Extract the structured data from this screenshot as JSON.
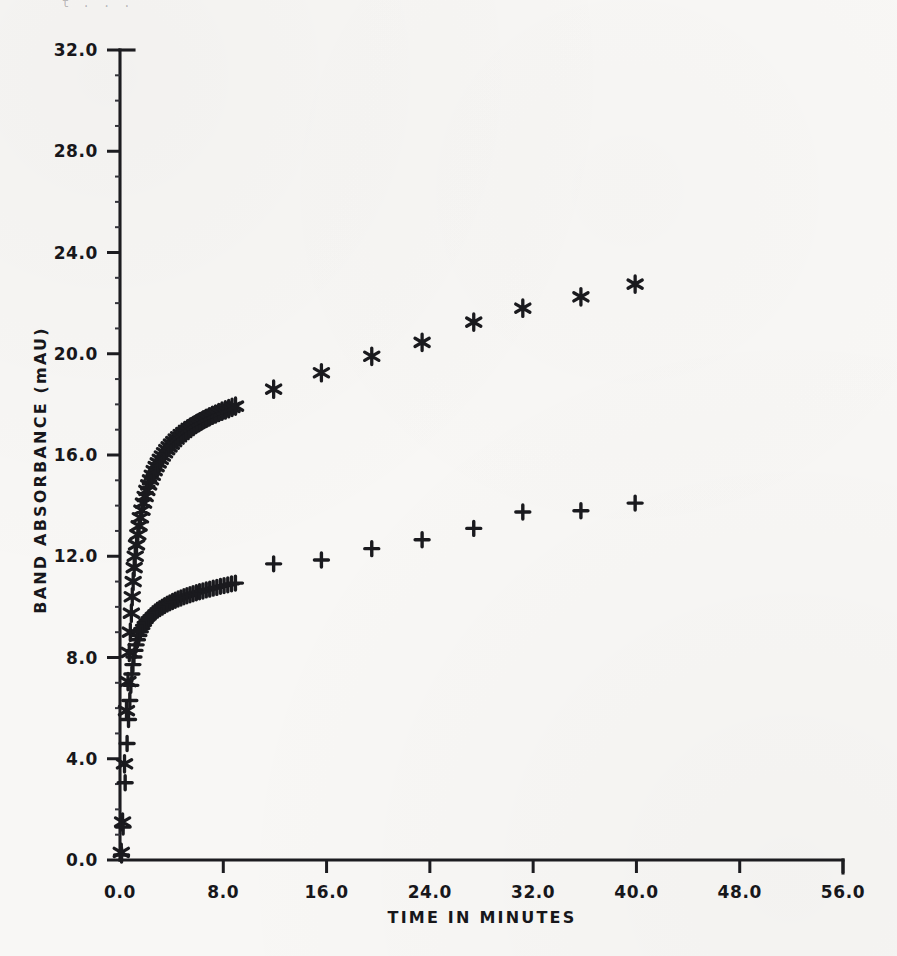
{
  "figure": {
    "background_color": "#f8f7f5",
    "ink_color": "#1a1a1e",
    "scan_artifact_top": "t .  .   ."
  },
  "axes": {
    "x_title": "TIME IN MINUTES",
    "y_title": "BAND ABSORBANCE (mAU)",
    "x_ticklabels": [
      "0.0",
      "8.0",
      "16.0",
      "24.0",
      "32.0",
      "40.0",
      "48.0",
      "56.0"
    ],
    "y_ticklabels": [
      "0.0",
      "4.0",
      "8.0",
      "12.0",
      "16.0",
      "20.0",
      "24.0",
      "28.0",
      "32.0"
    ]
  },
  "chart_data": {
    "type": "scatter",
    "title": "",
    "xlabel": "TIME IN MINUTES",
    "ylabel": "BAND ABSORBANCE (mAU)",
    "xlim": [
      0.0,
      56.0
    ],
    "ylim": [
      0.0,
      32.0
    ],
    "xticks": [
      0.0,
      8.0,
      16.0,
      24.0,
      32.0,
      40.0,
      48.0,
      56.0
    ],
    "yticks": [
      0.0,
      4.0,
      8.0,
      12.0,
      16.0,
      20.0,
      24.0,
      28.0,
      32.0
    ],
    "grid": false,
    "legend": "none",
    "series": [
      {
        "name": "asterisk-series",
        "marker": "asterisk",
        "color": "#1a1a1e",
        "points": [
          [
            0.1,
            0.3
          ],
          [
            0.2,
            1.5
          ],
          [
            0.35,
            3.8
          ],
          [
            0.5,
            5.9
          ],
          [
            0.62,
            7.05
          ],
          [
            0.72,
            8.2
          ],
          [
            0.8,
            9.0
          ],
          [
            0.88,
            9.75
          ],
          [
            0.95,
            10.4
          ],
          [
            1.02,
            11.0
          ],
          [
            1.1,
            11.55
          ],
          [
            1.18,
            12.0
          ],
          [
            1.28,
            12.45
          ],
          [
            1.38,
            12.85
          ],
          [
            1.48,
            13.2
          ],
          [
            1.58,
            13.52
          ],
          [
            1.7,
            13.82
          ],
          [
            1.82,
            14.1
          ],
          [
            1.95,
            14.36
          ],
          [
            2.08,
            14.6
          ],
          [
            2.22,
            14.82
          ],
          [
            2.36,
            15.02
          ],
          [
            2.5,
            15.2
          ],
          [
            2.65,
            15.38
          ],
          [
            2.8,
            15.54
          ],
          [
            2.96,
            15.69
          ],
          [
            3.12,
            15.83
          ],
          [
            3.28,
            15.96
          ],
          [
            3.45,
            16.09
          ],
          [
            3.62,
            16.21
          ],
          [
            3.8,
            16.32
          ],
          [
            3.98,
            16.43
          ],
          [
            4.16,
            16.53
          ],
          [
            4.35,
            16.63
          ],
          [
            4.54,
            16.72
          ],
          [
            4.74,
            16.81
          ],
          [
            4.94,
            16.89
          ],
          [
            5.14,
            16.97
          ],
          [
            5.35,
            17.05
          ],
          [
            5.56,
            17.12
          ],
          [
            5.78,
            17.19
          ],
          [
            6.0,
            17.26
          ],
          [
            6.22,
            17.32
          ],
          [
            6.45,
            17.39
          ],
          [
            6.68,
            17.45
          ],
          [
            6.92,
            17.51
          ],
          [
            7.16,
            17.57
          ],
          [
            7.4,
            17.62
          ],
          [
            7.65,
            17.68
          ],
          [
            7.9,
            17.73
          ],
          [
            8.16,
            17.78
          ],
          [
            8.42,
            17.83
          ],
          [
            8.68,
            17.88
          ],
          [
            8.95,
            17.93
          ],
          [
            11.9,
            18.6
          ],
          [
            15.6,
            19.25
          ],
          [
            19.5,
            19.9
          ],
          [
            23.4,
            20.45
          ],
          [
            27.4,
            21.25
          ],
          [
            31.2,
            21.8
          ],
          [
            35.7,
            22.25
          ],
          [
            39.9,
            22.75
          ]
        ]
      },
      {
        "name": "plus-series",
        "marker": "plus",
        "color": "#1a1a1e",
        "points": [
          [
            0.12,
            0.2
          ],
          [
            0.24,
            1.3
          ],
          [
            0.4,
            3.05
          ],
          [
            0.55,
            4.6
          ],
          [
            0.66,
            5.55
          ],
          [
            0.76,
            6.3
          ],
          [
            0.84,
            6.9
          ],
          [
            0.92,
            7.35
          ],
          [
            1.0,
            7.72
          ],
          [
            1.08,
            8.02
          ],
          [
            1.16,
            8.28
          ],
          [
            1.25,
            8.5
          ],
          [
            1.35,
            8.7
          ],
          [
            1.46,
            8.87
          ],
          [
            1.57,
            9.02
          ],
          [
            1.69,
            9.15
          ],
          [
            1.82,
            9.27
          ],
          [
            1.95,
            9.38
          ],
          [
            2.09,
            9.48
          ],
          [
            2.24,
            9.57
          ],
          [
            2.4,
            9.65
          ],
          [
            2.56,
            9.73
          ],
          [
            2.73,
            9.8
          ],
          [
            2.9,
            9.87
          ],
          [
            3.08,
            9.93
          ],
          [
            3.27,
            9.99
          ],
          [
            3.46,
            10.05
          ],
          [
            3.66,
            10.11
          ],
          [
            3.86,
            10.16
          ],
          [
            4.07,
            10.21
          ],
          [
            4.28,
            10.26
          ],
          [
            4.5,
            10.31
          ],
          [
            4.72,
            10.35
          ],
          [
            4.95,
            10.4
          ],
          [
            5.18,
            10.44
          ],
          [
            5.42,
            10.48
          ],
          [
            5.66,
            10.52
          ],
          [
            5.91,
            10.56
          ],
          [
            6.16,
            10.6
          ],
          [
            6.42,
            10.63
          ],
          [
            6.68,
            10.67
          ],
          [
            6.95,
            10.7
          ],
          [
            7.22,
            10.74
          ],
          [
            7.5,
            10.77
          ],
          [
            7.78,
            10.81
          ],
          [
            8.06,
            10.84
          ],
          [
            8.35,
            10.87
          ],
          [
            8.64,
            10.91
          ],
          [
            8.94,
            10.94
          ],
          [
            11.9,
            11.7
          ],
          [
            15.6,
            11.85
          ],
          [
            19.5,
            12.3
          ],
          [
            23.4,
            12.65
          ],
          [
            27.4,
            13.1
          ],
          [
            31.2,
            13.75
          ],
          [
            35.7,
            13.8
          ],
          [
            39.9,
            14.1
          ]
        ]
      }
    ]
  }
}
